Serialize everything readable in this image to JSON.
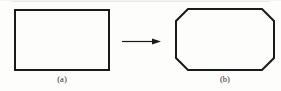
{
  "figure": {
    "background_color": "#fdfdfc",
    "stroke_color": "#1a1a1a",
    "artifact_color": "#e6e4e2",
    "panels": [
      {
        "id": "panel-a",
        "label": "(a)",
        "shape": "rectangle",
        "description": "plain rectangle",
        "x": 14,
        "y": 9,
        "width": 96,
        "height": 62,
        "stroke_width": 2
      },
      {
        "id": "panel-b",
        "label": "(b)",
        "shape": "octagon",
        "description": "rectangle with four chamfered corners",
        "x": 175,
        "y": 8,
        "width": 100,
        "height": 63,
        "chamfer": 12,
        "stroke_width": 2
      }
    ],
    "arrow": {
      "id": "transform-arrow",
      "direction": "right",
      "x1": 122,
      "y1": 41,
      "x2": 161,
      "y2": 41,
      "head_length": 9,
      "head_width": 6,
      "stroke_width": 1.2
    }
  }
}
